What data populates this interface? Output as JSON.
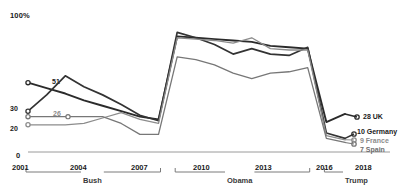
{
  "chart_data": {
    "type": "line",
    "title": "",
    "subtitle": "",
    "xlabel": "",
    "ylabel": "",
    "ylim": [
      0,
      100
    ],
    "xlim": [
      2001,
      2018
    ],
    "grid": false,
    "legend_position": "right-end-labels",
    "axis_top_label": "100%",
    "y_axis_zero_label": "0",
    "x_ticks": [
      "2001",
      "2004",
      "2007",
      "2010",
      "2013",
      "2016",
      "2018"
    ],
    "x_tick_values": [
      2001,
      2004,
      2007,
      2010,
      2013,
      2016,
      2018
    ],
    "x": [
      2001,
      2002,
      2003,
      2004,
      2005,
      2006,
      2007,
      2008,
      2009,
      2010,
      2011,
      2012,
      2013,
      2014,
      2015,
      2016,
      2017,
      2018
    ],
    "series": [
      {
        "name": "UK",
        "color": "#2b2b2b",
        "start_value_label": "51",
        "end_value_label": "28",
        "end_label": "28 UK",
        "values": [
          51,
          47,
          43,
          38,
          34,
          30,
          26,
          24,
          85,
          84,
          83,
          82,
          81,
          78,
          77,
          76,
          22,
          28
        ]
      },
      {
        "name": "Germany",
        "color": "#333333",
        "start_value_label": "30",
        "end_value_label": "10",
        "end_label": "10 Germany",
        "values": [
          30,
          42,
          56,
          48,
          42,
          35,
          27,
          23,
          88,
          84,
          79,
          72,
          76,
          72,
          71,
          77,
          14,
          10
        ]
      },
      {
        "name": "France",
        "color": "#8c8c8c",
        "start_value_label": "20",
        "end_value_label": "9",
        "end_label": "9 France",
        "values": [
          20,
          20,
          20,
          21,
          25,
          29,
          24,
          21,
          84,
          83,
          82,
          80,
          84,
          76,
          75,
          75,
          12,
          9
        ]
      },
      {
        "name": "Spain",
        "color": "#777777",
        "start_value_label": "26",
        "end_value_label": "7",
        "end_label": "7 Spain",
        "values": [
          26,
          26,
          26,
          26,
          26,
          21,
          13,
          13,
          70,
          68,
          64,
          58,
          54,
          58,
          59,
          62,
          10,
          7
        ]
      }
    ],
    "start_labels": [
      {
        "text": "51",
        "value": 51,
        "series": "UK",
        "color": "#1a1a1a"
      },
      {
        "text": "30",
        "value": 30,
        "series": "Germany",
        "color": "#1a1a1a"
      },
      {
        "text": "26",
        "value": 26,
        "series": "Spain",
        "color": "#8c8c8c"
      },
      {
        "text": "20",
        "value": 20,
        "series": "France",
        "color": "#8c8c8c"
      }
    ],
    "eras": [
      {
        "label": "Bush",
        "start": 2001,
        "end": 2008
      },
      {
        "label": "Obama",
        "start": 2009,
        "end": 2016
      },
      {
        "label": "Trump",
        "start": 2017,
        "end": 2018
      }
    ]
  }
}
